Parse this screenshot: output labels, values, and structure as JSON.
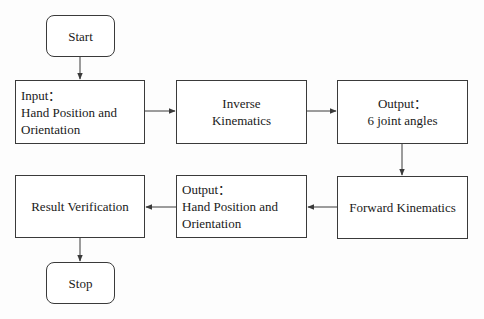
{
  "diagram": {
    "type": "flowchart",
    "colors": {
      "stroke": "#3a3a3a",
      "text": "#1a1a1a",
      "background": "#ffffff"
    },
    "nodes": {
      "start": {
        "shape": "rounded-rect",
        "lines": [
          "Start"
        ]
      },
      "input": {
        "shape": "rect",
        "lines": [
          "Input：",
          "Hand Position and",
          "Orientation"
        ]
      },
      "ik": {
        "shape": "rect",
        "lines": [
          "Inverse",
          "Kinematics"
        ]
      },
      "joint": {
        "shape": "rect",
        "lines": [
          "Output：",
          "6 joint angles"
        ]
      },
      "fk": {
        "shape": "rect",
        "lines": [
          "Forward Kinematics"
        ]
      },
      "outhand": {
        "shape": "rect",
        "lines": [
          "Output：",
          "Hand Position and",
          "Orientation"
        ]
      },
      "verify": {
        "shape": "rect",
        "lines": [
          "Result Verification"
        ]
      },
      "stop": {
        "shape": "rounded-rect",
        "lines": [
          "Stop"
        ]
      }
    },
    "edges": [
      {
        "from": "start",
        "to": "input"
      },
      {
        "from": "input",
        "to": "ik"
      },
      {
        "from": "ik",
        "to": "joint"
      },
      {
        "from": "joint",
        "to": "fk"
      },
      {
        "from": "fk",
        "to": "outhand"
      },
      {
        "from": "outhand",
        "to": "verify"
      },
      {
        "from": "verify",
        "to": "stop"
      }
    ]
  }
}
